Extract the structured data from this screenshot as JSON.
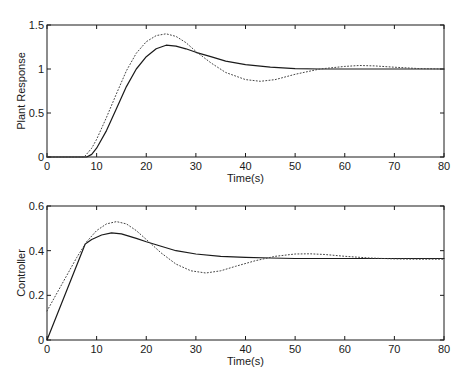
{
  "chart_data": [
    {
      "type": "line",
      "title": "",
      "xlabel": "Time(s)",
      "ylabel": "Plant Response",
      "xlim": [
        0,
        80
      ],
      "ylim": [
        0,
        1.5
      ],
      "xticks": [
        0,
        10,
        20,
        30,
        40,
        50,
        60,
        70,
        80
      ],
      "yticks": [
        0,
        0.5,
        1,
        1.5
      ],
      "ytick_labels": [
        "0",
        "0.5",
        "1",
        "1.5"
      ],
      "grid": false,
      "legend": null,
      "series": [
        {
          "name": "solid",
          "style": "solid",
          "x": [
            0,
            8,
            9,
            10,
            12,
            14,
            16,
            18,
            20,
            22,
            24,
            26,
            28,
            30,
            33,
            36,
            40,
            45,
            50,
            55,
            60,
            70,
            80
          ],
          "y": [
            0,
            0,
            0.03,
            0.1,
            0.3,
            0.55,
            0.8,
            1.0,
            1.14,
            1.23,
            1.27,
            1.26,
            1.23,
            1.19,
            1.14,
            1.09,
            1.05,
            1.02,
            1.005,
            1.0,
            1.0,
            1.0,
            1.0
          ]
        },
        {
          "name": "dotted",
          "style": "dotted",
          "x": [
            0,
            7.5,
            9,
            10,
            12,
            14,
            16,
            18,
            20,
            22,
            24,
            26,
            28,
            30,
            33,
            36,
            40,
            43,
            46,
            50,
            55,
            60,
            63,
            66,
            70,
            75,
            80
          ],
          "y": [
            0,
            0,
            0.1,
            0.2,
            0.45,
            0.72,
            0.98,
            1.18,
            1.31,
            1.38,
            1.4,
            1.37,
            1.3,
            1.2,
            1.07,
            0.96,
            0.88,
            0.86,
            0.88,
            0.94,
            1.0,
            1.03,
            1.04,
            1.035,
            1.02,
            1.005,
            1.0
          ]
        }
      ]
    },
    {
      "type": "line",
      "title": "",
      "xlabel": "Time(s)",
      "ylabel": "Controller",
      "xlim": [
        0,
        80
      ],
      "ylim": [
        0,
        0.6
      ],
      "xticks": [
        0,
        10,
        20,
        30,
        40,
        50,
        60,
        70,
        80
      ],
      "yticks": [
        0,
        0.2,
        0.4,
        0.6
      ],
      "ytick_labels": [
        "0",
        "0.2",
        "0.4",
        "0.6"
      ],
      "grid": false,
      "legend": null,
      "series": [
        {
          "name": "solid",
          "style": "solid",
          "x": [
            0,
            7.7,
            9,
            11,
            13,
            15,
            18,
            20,
            23,
            26,
            30,
            35,
            40,
            45,
            50,
            60,
            70,
            80
          ],
          "y": [
            0,
            0.43,
            0.45,
            0.47,
            0.48,
            0.475,
            0.455,
            0.44,
            0.42,
            0.4,
            0.385,
            0.375,
            0.37,
            0.367,
            0.365,
            0.365,
            0.365,
            0.365
          ]
        },
        {
          "name": "dotted",
          "style": "dotted",
          "x": [
            0,
            3,
            6,
            8,
            10,
            12,
            14,
            16,
            18,
            20,
            23,
            26,
            29,
            32,
            35,
            38,
            42,
            46,
            50,
            53,
            56,
            60,
            65,
            70,
            75,
            80
          ],
          "y": [
            0.13,
            0.25,
            0.37,
            0.44,
            0.49,
            0.52,
            0.53,
            0.52,
            0.49,
            0.45,
            0.39,
            0.34,
            0.31,
            0.3,
            0.31,
            0.33,
            0.355,
            0.375,
            0.385,
            0.386,
            0.383,
            0.375,
            0.367,
            0.363,
            0.362,
            0.362
          ]
        }
      ]
    }
  ],
  "panels": [
    {
      "ylabel": "Plant Response",
      "xlabel": "Time(s)"
    },
    {
      "ylabel": "Controller",
      "xlabel": "Time(s)"
    }
  ],
  "colors": {
    "axis": "#1a1a1a",
    "solid": "#1a1a1a",
    "dotted": "#444444",
    "background": "#ffffff"
  }
}
